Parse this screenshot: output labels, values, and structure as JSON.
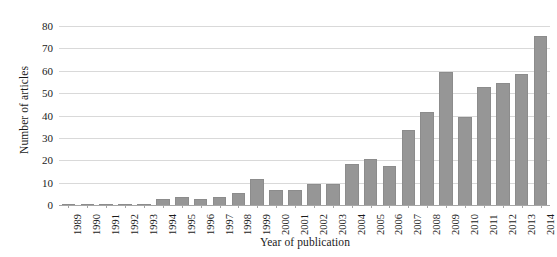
{
  "chart_data": {
    "type": "bar",
    "title": "",
    "subtitle": "",
    "xlabel": "Year of publication",
    "ylabel": "Number of articles",
    "categories": [
      "1989",
      "1990",
      "1991",
      "1992",
      "1993",
      "1994",
      "1995",
      "1996",
      "1997",
      "1998",
      "1999",
      "2000",
      "2001",
      "2002",
      "2003",
      "2004",
      "2005",
      "2006",
      "2007",
      "2008",
      "2009",
      "2010",
      "2011",
      "2012",
      "2013",
      "2014"
    ],
    "values": [
      1,
      0,
      1,
      1,
      0,
      3,
      4,
      3,
      4,
      6,
      12,
      7,
      7,
      10,
      10,
      19,
      21,
      18,
      34,
      42,
      60,
      40,
      53,
      55,
      59,
      76
    ],
    "ylim": [
      0,
      80
    ],
    "yticks": [
      0,
      10,
      20,
      30,
      40,
      50,
      60,
      70,
      80
    ],
    "ytick_labels": [
      "0",
      "10",
      "20",
      "30",
      "40",
      "50",
      "60",
      "70",
      "80"
    ],
    "grid": true,
    "legend": false,
    "legend_position": "none",
    "bar_color": "#969696",
    "gridline_color": "#d9d9d9",
    "axis_color": "#a6a6a6",
    "background_color": "#ffffff"
  }
}
